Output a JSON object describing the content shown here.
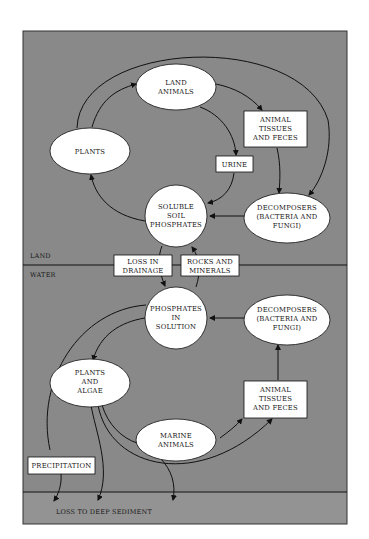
{
  "diagram": {
    "regions": {
      "land_label": "LAND",
      "water_label": "WATER",
      "sediment_label": "LOSS TO DEEP SEDIMENT"
    },
    "colors": {
      "background": "#898989",
      "sediment_band": "#939393",
      "node_fill": "#ffffff",
      "stroke": "#111111"
    },
    "nodes": {
      "land_animals": [
        "LAND",
        "ANIMALS"
      ],
      "plants": [
        "PLANTS"
      ],
      "land_tissues": [
        "ANIMAL",
        "TISSUES",
        "AND FECES"
      ],
      "urine": [
        "URINE"
      ],
      "soluble_soil_phosphates": [
        "SOLUBLE",
        "SOIL",
        "PHOSPHATES"
      ],
      "land_decomposers": [
        "DECOMPOSERS",
        "(BACTERIA AND",
        "FUNGI)"
      ],
      "loss_in_drainage": [
        "LOSS IN",
        "DRAINAGE"
      ],
      "rocks_and_minerals": [
        "ROCKS AND",
        "MINERALS"
      ],
      "phosphates_in_solution": [
        "PHOSPHATES",
        "IN",
        "SOLUTION"
      ],
      "water_decomposers": [
        "DECOMPOSERS",
        "(BACTERIA AND",
        "FUNGI)"
      ],
      "plants_and_algae": [
        "PLANTS",
        "AND",
        "ALGAE"
      ],
      "water_tissues": [
        "ANIMAL",
        "TISSUES",
        "AND FECES"
      ],
      "marine_animals": [
        "MARINE",
        "ANIMALS"
      ],
      "precipitation": [
        "PRECIPITATION"
      ]
    }
  }
}
